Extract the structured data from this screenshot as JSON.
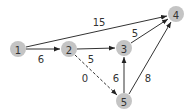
{
  "graph": {
    "nodes": [
      {
        "id": "1",
        "label": "1",
        "x": 18,
        "y": 49
      },
      {
        "id": "2",
        "label": "2",
        "x": 69,
        "y": 49
      },
      {
        "id": "3",
        "label": "3",
        "x": 124,
        "y": 48
      },
      {
        "id": "4",
        "label": "4",
        "x": 176,
        "y": 14
      },
      {
        "id": "5",
        "label": "5",
        "x": 124,
        "y": 101
      }
    ],
    "edges": [
      {
        "from": "1",
        "to": "2",
        "weight": "6",
        "style": "solid"
      },
      {
        "from": "1",
        "to": "4",
        "weight": "15",
        "style": "solid"
      },
      {
        "from": "2",
        "to": "3",
        "weight": "5",
        "style": "solid"
      },
      {
        "from": "2",
        "to": "5",
        "weight": "0",
        "style": "dashed"
      },
      {
        "from": "3",
        "to": "4",
        "weight": "5",
        "style": "solid"
      },
      {
        "from": "5",
        "to": "3",
        "weight": "6",
        "style": "solid"
      },
      {
        "from": "5",
        "to": "4",
        "weight": "8",
        "style": "solid"
      }
    ]
  }
}
